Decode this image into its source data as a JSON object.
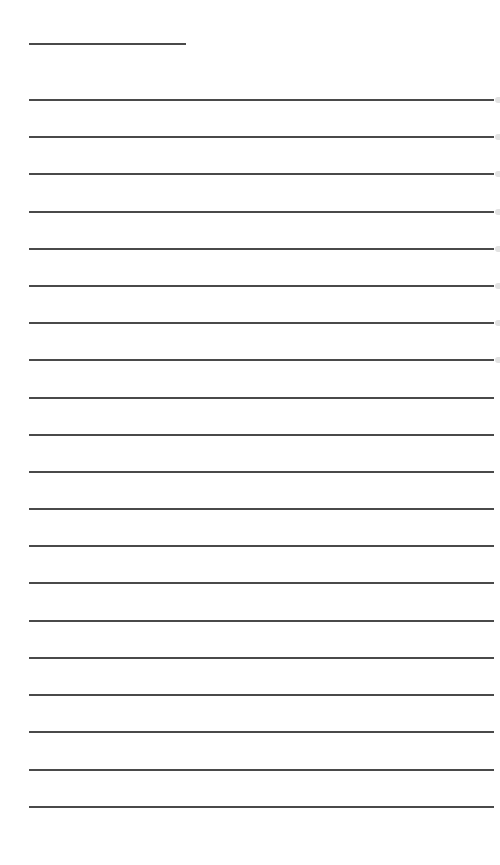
{
  "page": {
    "type": "blank lined paper",
    "background": "#ffffff",
    "line_color": "#4a4a4a",
    "header_line": {
      "left": 29,
      "top": 43,
      "width": 157
    },
    "ruled_lines": {
      "count": 20,
      "left": 29,
      "width": 465,
      "tops": [
        99,
        136,
        173,
        211,
        248,
        285,
        322,
        359,
        397,
        434,
        471,
        508,
        545,
        582,
        620,
        657,
        694,
        731,
        769,
        806
      ]
    },
    "edge_marks": {
      "count": 8
    }
  }
}
